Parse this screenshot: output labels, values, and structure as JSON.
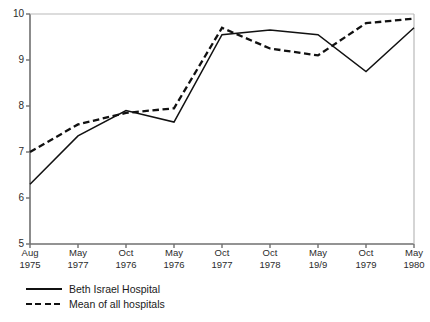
{
  "chart_data": {
    "type": "line",
    "title": "",
    "xlabel": "",
    "ylabel": "",
    "ylim": [
      5,
      10
    ],
    "yticks": [
      5,
      6,
      7,
      8,
      9,
      10
    ],
    "grid": false,
    "legend_position": "below-left",
    "categories": [
      {
        "month": "Aug",
        "year": "1975"
      },
      {
        "month": "May",
        "year": "1977"
      },
      {
        "month": "Oct",
        "year": "1976"
      },
      {
        "month": "May",
        "year": "1976"
      },
      {
        "month": "Oct",
        "year": "1977"
      },
      {
        "month": "Oct",
        "year": "1978"
      },
      {
        "month": "May",
        "year": "19/9"
      },
      {
        "month": "Oct",
        "year": "1979"
      },
      {
        "month": "May",
        "year": "1980"
      }
    ],
    "series": [
      {
        "name": "Beth Israel Hospital",
        "style": "solid",
        "color": "#111111",
        "values": [
          6.3,
          7.35,
          7.9,
          7.65,
          9.55,
          9.65,
          9.55,
          8.75,
          9.7
        ]
      },
      {
        "name": "Mean of all hospitals",
        "style": "dashed",
        "color": "#111111",
        "values": [
          7.0,
          7.6,
          7.85,
          7.95,
          9.7,
          9.25,
          9.1,
          9.8,
          9.9
        ]
      }
    ]
  },
  "axis": {
    "y_tick_labels": [
      "10",
      "9",
      "8",
      "7",
      "6",
      "5"
    ]
  },
  "legend": {
    "items": [
      {
        "label": "Beth Israel Hospital",
        "style": "solid"
      },
      {
        "label": "Mean of all hospitals",
        "style": "dashed"
      }
    ]
  }
}
